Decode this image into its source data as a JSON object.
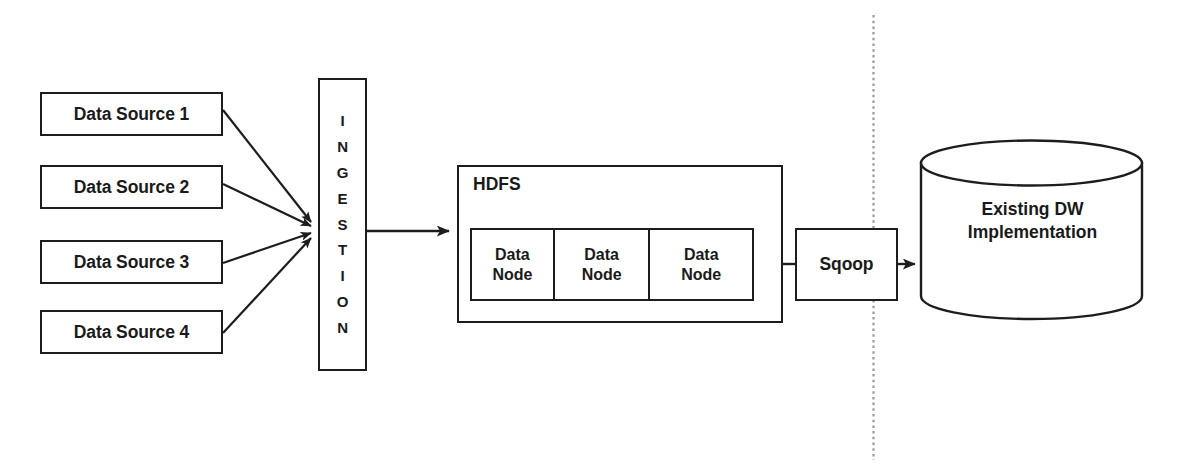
{
  "diagram": {
    "stroke_color": "#1d1d1d",
    "background_color": "#ffffff",
    "divider_color": "#8a8a8a",
    "sources": [
      {
        "label": "Data Source 1"
      },
      {
        "label": "Data Source 2"
      },
      {
        "label": "Data Source 3"
      },
      {
        "label": "Data Source 4"
      }
    ],
    "ingestion": {
      "label": "INGESTION",
      "letters": [
        "I",
        "N",
        "G",
        "E",
        "S",
        "T",
        "I",
        "O",
        "N"
      ]
    },
    "hdfs": {
      "label": "HDFS",
      "data_nodes": [
        {
          "line1": "Data",
          "line2": "Node"
        },
        {
          "line1": "Data",
          "line2": "Node"
        },
        {
          "line1": "Data",
          "line2": "Node"
        }
      ]
    },
    "sqoop": {
      "label": "Sqoop"
    },
    "warehouse": {
      "line1": "Existing DW",
      "line2": "Implementation"
    },
    "divider": {
      "style": "dotted-vertical"
    }
  }
}
